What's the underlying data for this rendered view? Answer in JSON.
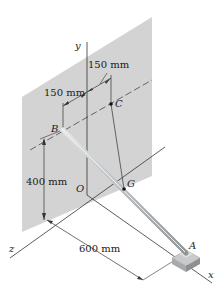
{
  "figure": {
    "axes": {
      "x": "x",
      "y": "y",
      "z": "z"
    },
    "points": {
      "origin": "O",
      "B": "B",
      "C": "C",
      "G": "G",
      "A": "A"
    },
    "dimensions": {
      "bc_horizontal_left": "150 mm",
      "bc_horizontal_right": "150 mm",
      "b_height": "400 mm",
      "a_distance": "600 mm"
    },
    "colors": {
      "wall": "#cfcfcf",
      "rod": "#b9bdbf",
      "lines": "#333333",
      "background": "#ffffff"
    }
  }
}
